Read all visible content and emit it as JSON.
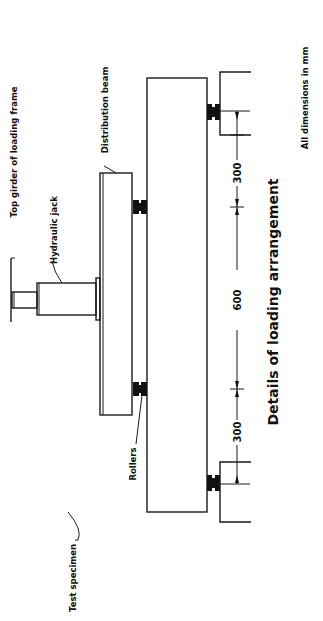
{
  "diagram": {
    "title": "Details of loading arrangement",
    "note": "All dimensions in mm",
    "labels": {
      "top_girder": "Top girder of loading frame",
      "hydraulic_jack": "Hydraulic jack",
      "distribution_beam": "Distribution beam",
      "rollers": "Rollers",
      "test_specimen": "Test specimen"
    },
    "dimensions": {
      "left_shear_span": "300",
      "middle_span": "600",
      "right_shear_span": "300"
    },
    "orientation": "rotated 90 degrees counter-clockwise",
    "colors": {
      "line": "#1a1a1a",
      "background": "#ffffff"
    }
  }
}
